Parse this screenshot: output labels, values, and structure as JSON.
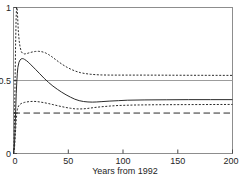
{
  "chart_data": {
    "type": "line",
    "title": "",
    "xlabel": "Years from 1992",
    "ylabel": "",
    "xlim": [
      0,
      200
    ],
    "ylim": [
      0,
      1
    ],
    "xticks": [
      0,
      50,
      100,
      150,
      200
    ],
    "xticklabels": [
      "0",
      "50",
      "100",
      "150",
      "200"
    ],
    "yticks": [
      0,
      0.5,
      1
    ],
    "yticklabels": [
      "0",
      "0.5",
      "1"
    ],
    "grid": "single horizontal gridline at y = 0.5",
    "legend": null,
    "frame": "full box (top, right, bottom, left borders drawn)",
    "series": [
      {
        "name": "point-estimate",
        "style": "solid",
        "label": "",
        "points": [
          [
            0,
            0
          ],
          [
            0.5,
            0.02
          ],
          [
            1,
            0.08
          ],
          [
            1.5,
            0.18
          ],
          [
            2,
            0.3
          ],
          [
            2.5,
            0.41
          ],
          [
            3,
            0.49
          ],
          [
            3.5,
            0.55
          ],
          [
            4,
            0.59
          ],
          [
            5,
            0.625
          ],
          [
            6,
            0.64
          ],
          [
            7,
            0.648
          ],
          [
            8,
            0.65
          ],
          [
            9,
            0.649
          ],
          [
            10,
            0.645
          ],
          [
            12,
            0.635
          ],
          [
            14,
            0.622
          ],
          [
            16,
            0.607
          ],
          [
            18,
            0.592
          ],
          [
            20,
            0.577
          ],
          [
            24,
            0.546
          ],
          [
            28,
            0.515
          ],
          [
            32,
            0.487
          ],
          [
            36,
            0.462
          ],
          [
            40,
            0.44
          ],
          [
            44,
            0.42
          ],
          [
            48,
            0.402
          ],
          [
            52,
            0.386
          ],
          [
            56,
            0.372
          ],
          [
            60,
            0.362
          ],
          [
            64,
            0.356
          ],
          [
            68,
            0.353
          ],
          [
            72,
            0.352
          ],
          [
            76,
            0.353
          ],
          [
            80,
            0.355
          ],
          [
            88,
            0.359
          ],
          [
            96,
            0.362
          ],
          [
            104,
            0.365
          ],
          [
            120,
            0.367
          ],
          [
            140,
            0.368
          ],
          [
            160,
            0.369
          ],
          [
            180,
            0.369
          ],
          [
            200,
            0.369
          ]
        ]
      },
      {
        "name": "upper-confidence-bound",
        "style": "dotted",
        "label": "",
        "points": [
          [
            0,
            0
          ],
          [
            0.4,
            0.05
          ],
          [
            0.9,
            0.22
          ],
          [
            1.4,
            0.48
          ],
          [
            1.9,
            0.74
          ],
          [
            2.4,
            0.93
          ],
          [
            2.8,
            1.0
          ],
          [
            3.3,
            1.0
          ],
          [
            3.8,
            0.93
          ],
          [
            4.4,
            0.84
          ],
          [
            5.2,
            0.77
          ],
          [
            6,
            0.73
          ],
          [
            7,
            0.7
          ],
          [
            8,
            0.688
          ],
          [
            10,
            0.682
          ],
          [
            12,
            0.684
          ],
          [
            14,
            0.689
          ],
          [
            17,
            0.695
          ],
          [
            20,
            0.699
          ],
          [
            23,
            0.7
          ],
          [
            26,
            0.697
          ],
          [
            29,
            0.69
          ],
          [
            32,
            0.678
          ],
          [
            35,
            0.663
          ],
          [
            38,
            0.646
          ],
          [
            41,
            0.629
          ],
          [
            45,
            0.608
          ],
          [
            49,
            0.59
          ],
          [
            53,
            0.575
          ],
          [
            57,
            0.563
          ],
          [
            61,
            0.554
          ],
          [
            65,
            0.548
          ],
          [
            70,
            0.543
          ],
          [
            75,
            0.54
          ],
          [
            80,
            0.538
          ],
          [
            90,
            0.537
          ],
          [
            100,
            0.537
          ],
          [
            120,
            0.537
          ],
          [
            150,
            0.536
          ],
          [
            200,
            0.535
          ]
        ]
      },
      {
        "name": "lower-confidence-bound",
        "style": "dotted",
        "label": "",
        "points": [
          [
            0,
            0
          ],
          [
            0.5,
            0.01
          ],
          [
            1,
            0.05
          ],
          [
            1.5,
            0.11
          ],
          [
            2,
            0.17
          ],
          [
            2.5,
            0.23
          ],
          [
            3,
            0.27
          ],
          [
            3.5,
            0.3
          ],
          [
            4,
            0.315
          ],
          [
            5,
            0.33
          ],
          [
            6,
            0.337
          ],
          [
            7,
            0.342
          ],
          [
            8,
            0.345
          ],
          [
            10,
            0.35
          ],
          [
            12,
            0.353
          ],
          [
            15,
            0.356
          ],
          [
            18,
            0.357
          ],
          [
            21,
            0.356
          ],
          [
            24,
            0.353
          ],
          [
            28,
            0.348
          ],
          [
            32,
            0.342
          ],
          [
            36,
            0.335
          ],
          [
            40,
            0.328
          ],
          [
            44,
            0.321
          ],
          [
            48,
            0.315
          ],
          [
            52,
            0.31
          ],
          [
            56,
            0.306
          ],
          [
            60,
            0.305
          ],
          [
            64,
            0.306
          ],
          [
            68,
            0.309
          ],
          [
            74,
            0.315
          ],
          [
            80,
            0.32
          ],
          [
            88,
            0.325
          ],
          [
            96,
            0.329
          ],
          [
            110,
            0.332
          ],
          [
            130,
            0.334
          ],
          [
            160,
            0.335
          ],
          [
            200,
            0.336
          ]
        ]
      },
      {
        "name": "reference-level",
        "style": "long-dashed",
        "label": "",
        "points": [
          [
            0,
            0.277
          ],
          [
            200,
            0.277
          ]
        ]
      }
    ]
  },
  "colors": {
    "curve": "#2b2b2b",
    "frame": "#8d8d8d",
    "grid": "#9c9c9c",
    "text": "#252525",
    "background": "#ffffff"
  }
}
